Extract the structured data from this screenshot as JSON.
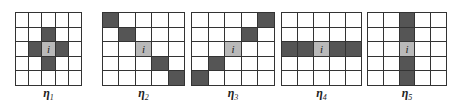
{
  "figure": {
    "rows": 5,
    "cols": 5,
    "center_label": "i",
    "colors": {
      "dark": "#555555",
      "center": "#b9b9b9",
      "empty": "#ffffff",
      "line": "#333333"
    },
    "panels": [
      {
        "name": "eta-1",
        "symbol": "η",
        "subscript": "1",
        "x": 15,
        "width": 67,
        "dark_cells": [
          [
            1,
            2
          ],
          [
            2,
            1
          ],
          [
            2,
            3
          ],
          [
            3,
            2
          ]
        ]
      },
      {
        "name": "eta-2",
        "symbol": "η",
        "subscript": "2",
        "x": 102,
        "width": 83,
        "dark_cells": [
          [
            0,
            0
          ],
          [
            1,
            1
          ],
          [
            3,
            3
          ],
          [
            4,
            4
          ]
        ]
      },
      {
        "name": "eta-3",
        "symbol": "η",
        "subscript": "3",
        "x": 191,
        "width": 84,
        "dark_cells": [
          [
            0,
            4
          ],
          [
            1,
            3
          ],
          [
            3,
            1
          ],
          [
            4,
            0
          ]
        ]
      },
      {
        "name": "eta-4",
        "symbol": "η",
        "subscript": "4",
        "x": 281,
        "width": 81,
        "dark_cells": [
          [
            2,
            0
          ],
          [
            2,
            1
          ],
          [
            2,
            3
          ],
          [
            2,
            4
          ]
        ]
      },
      {
        "name": "eta-5",
        "symbol": "η",
        "subscript": "5",
        "x": 367,
        "width": 80,
        "dark_cells": [
          [
            0,
            2
          ],
          [
            1,
            2
          ],
          [
            3,
            2
          ],
          [
            4,
            2
          ]
        ]
      }
    ]
  }
}
